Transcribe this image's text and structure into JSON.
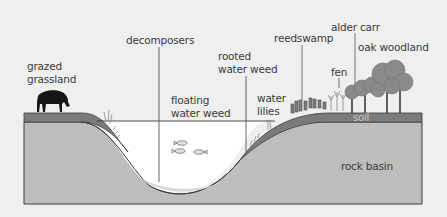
{
  "diagram": {
    "colors": {
      "background": "#efefef",
      "rock": "#bdbdbd",
      "soil": "#7b7b7b",
      "water": "#ffffff",
      "outline": "#3c3c3c",
      "tree": "#8a8a8a",
      "cow": "#151515"
    },
    "labels": {
      "grazed_grassland_1": "grazed",
      "grazed_grassland_2": "grassland",
      "decomposers": "decomposers",
      "rooted_water_weed_1": "rooted",
      "rooted_water_weed_2": "water weed",
      "floating_water_weed_1": "floating",
      "floating_water_weed_2": "water weed",
      "water_lilies_1": "water",
      "water_lilies_2": "lilies",
      "reedswamp": "reedswamp",
      "fen": "fen",
      "alder_carr": "alder carr",
      "oak_woodland": "oak woodland",
      "soil": "soil",
      "rock_basin": "rock basin"
    }
  }
}
